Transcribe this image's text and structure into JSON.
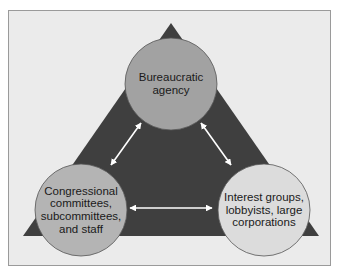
{
  "diagram": {
    "type": "iron-triangle",
    "colors": {
      "background": "#ffffff",
      "frame_fill": "#ebebeb",
      "frame_border": "#9a9a9a",
      "triangle_fill": "#3f3f3f",
      "arrow_color": "#ffffff",
      "node_top_fill": "#a2a2a2",
      "node_left_fill": "#b4b4b4",
      "node_right_fill": "#dcdcdc"
    },
    "nodes": [
      {
        "id": "top",
        "label": "Bureaucratic\nagency"
      },
      {
        "id": "left",
        "label": "Congressional\ncommittees,\nsubcommittees,\nand staff"
      },
      {
        "id": "right",
        "label": "Interest groups,\nlobbyists, large\ncorporations"
      }
    ],
    "edges": [
      {
        "from": "top",
        "to": "left",
        "bidirectional": true
      },
      {
        "from": "top",
        "to": "right",
        "bidirectional": true
      },
      {
        "from": "left",
        "to": "right",
        "bidirectional": true
      }
    ]
  }
}
